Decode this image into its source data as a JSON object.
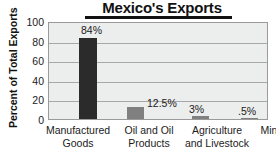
{
  "chart_data": {
    "type": "bar",
    "title": "Mexico's Exports",
    "xlabel": "",
    "ylabel": "Percent of Total Exports",
    "ylim": [
      0,
      100
    ],
    "ytick_step": 20,
    "grid": true,
    "legend": "none",
    "categories": [
      "Manufactured Goods",
      "Oil and Oil Products",
      "Agriculture and Livestock",
      "Mining"
    ],
    "values": [
      84,
      12.5,
      3,
      0.5
    ],
    "value_labels": [
      "84%",
      "12.5%",
      "3%",
      ".5%"
    ],
    "ytick_labels": [
      "100",
      "80",
      "60",
      "40",
      "20",
      "0"
    ],
    "bar_colors": [
      "#2b2b2b",
      "#808080",
      "#808080",
      "#808080"
    ]
  },
  "colors": {
    "plot_background": "#eceded",
    "gridline": "#a8a8a8",
    "plot_border": "#9a9a9a",
    "text": "#1b1b1b",
    "title": "#111111"
  },
  "categories_multiline": [
    {
      "line1": "Manufactured",
      "line2": "Goods"
    },
    {
      "line1": "Oil and Oil",
      "line2": "Products"
    },
    {
      "line1": "Agriculture",
      "line2": "and Livestock"
    },
    {
      "line1": "Mining",
      "line2": ""
    }
  ]
}
